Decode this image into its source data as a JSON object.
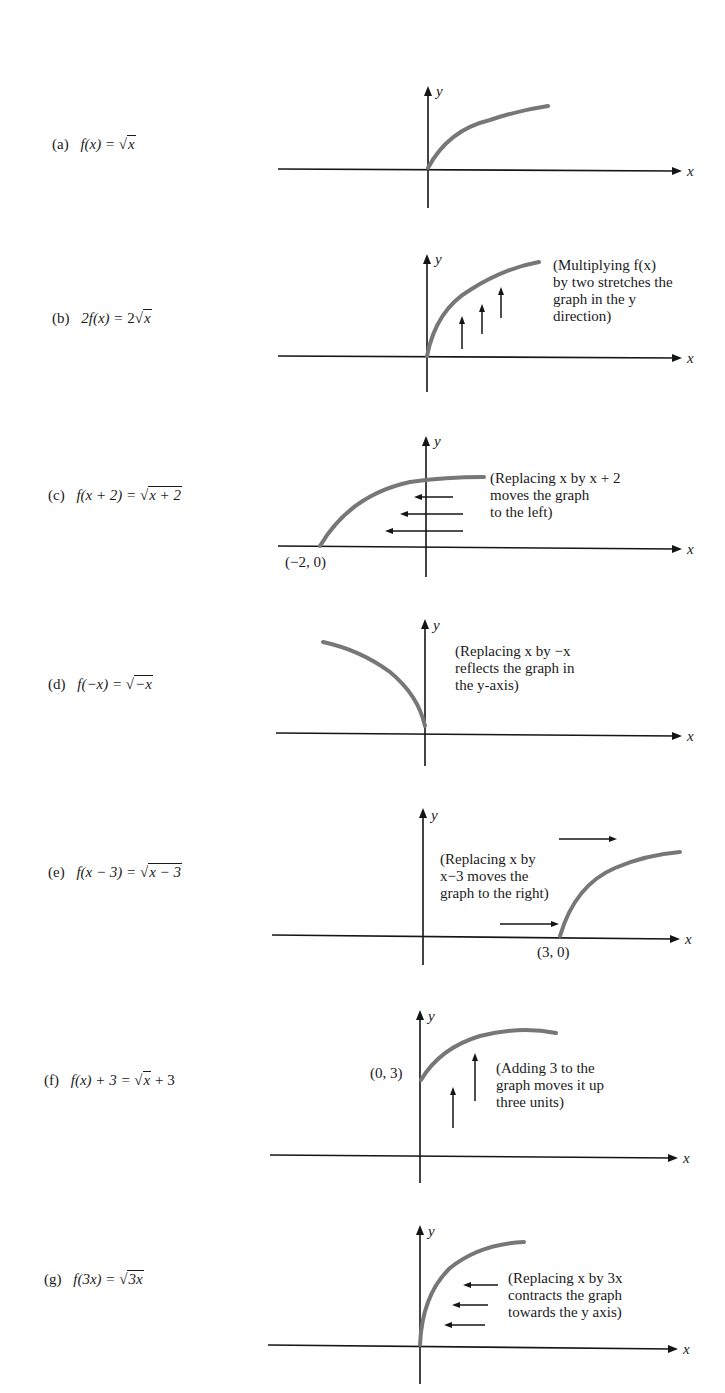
{
  "figure": {
    "panels": [
      {
        "id": "a",
        "tag": "(a)",
        "lhs": "f(x) =",
        "rhs_prefix": "",
        "radicand": "x",
        "rhs_suffix": "",
        "note": "",
        "point_label": "",
        "transformation": "base function"
      },
      {
        "id": "b",
        "tag": "(b)",
        "lhs": "2f(x) =",
        "rhs_prefix": "2",
        "radicand": "x",
        "rhs_suffix": "",
        "note": "(Multiplying f(x)\nby two stretches the\ngraph in the y\ndirection)",
        "point_label": "",
        "transformation": "vertical stretch by 2"
      },
      {
        "id": "c",
        "tag": "(c)",
        "lhs": "f(x + 2) =",
        "rhs_prefix": "",
        "radicand": "x + 2",
        "rhs_suffix": "",
        "note": "(Replacing x by x + 2\nmoves the graph\nto the left)",
        "point_label": "(−2, 0)",
        "transformation": "shift left 2"
      },
      {
        "id": "d",
        "tag": "(d)",
        "lhs": "f(−x) =",
        "rhs_prefix": "",
        "radicand": "−x",
        "rhs_suffix": "",
        "note": "(Replacing x by −x\nreflects the graph in\nthe y-axis)",
        "point_label": "",
        "transformation": "reflect in y-axis"
      },
      {
        "id": "e",
        "tag": "(e)",
        "lhs": "f(x − 3) =",
        "rhs_prefix": "",
        "radicand": "x − 3",
        "rhs_suffix": "",
        "note": "(Replacing x by\nx−3 moves the\ngraph to the right)",
        "point_label": "(3, 0)",
        "transformation": "shift right 3"
      },
      {
        "id": "f",
        "tag": "(f)",
        "lhs": "f(x) + 3 =",
        "rhs_prefix": "",
        "radicand": "x",
        "rhs_suffix": " + 3",
        "note": "(Adding 3 to the\ngraph moves it up\nthree units)",
        "point_label": "(0, 3)",
        "transformation": "shift up 3"
      },
      {
        "id": "g",
        "tag": "(g)",
        "lhs": "f(3x) =",
        "rhs_prefix": "",
        "radicand": "3x",
        "rhs_suffix": "",
        "note": "(Replacing x by 3x\ncontracts the graph\ntowards the y axis)",
        "point_label": "",
        "transformation": "horizontal contraction by 3"
      }
    ],
    "axis_labels": {
      "x": "x",
      "y": "y"
    },
    "colors": {
      "curve": "#777777",
      "axis": "#151515",
      "text": "#1a1a1a",
      "background": "#ffffff"
    }
  }
}
